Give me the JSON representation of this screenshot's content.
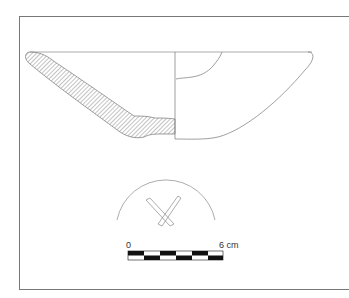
{
  "figure": {
    "type": "ceramic-bowl-profile-drawing",
    "scale_bar": {
      "start_label": "0",
      "end_label": "6 cm",
      "segments": 6
    },
    "colors": {
      "line": "#777777",
      "hatch": "#888888",
      "black": "#111111"
    }
  }
}
